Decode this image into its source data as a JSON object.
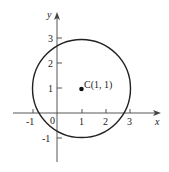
{
  "figure": {
    "type": "circle-on-coordinate-plane",
    "axes": {
      "x_label": "x",
      "y_label": "y",
      "x_ticks": [
        "-1",
        "1",
        "2",
        "3"
      ],
      "y_ticks": [
        "3",
        "2",
        "1",
        "-1"
      ],
      "origin_label": "0"
    },
    "circle": {
      "center": [
        1,
        1
      ],
      "radius": 2
    },
    "center_point": {
      "label": "C(1, 1)"
    },
    "colors": {
      "stroke": "#222222",
      "background": "#ffffff"
    }
  }
}
